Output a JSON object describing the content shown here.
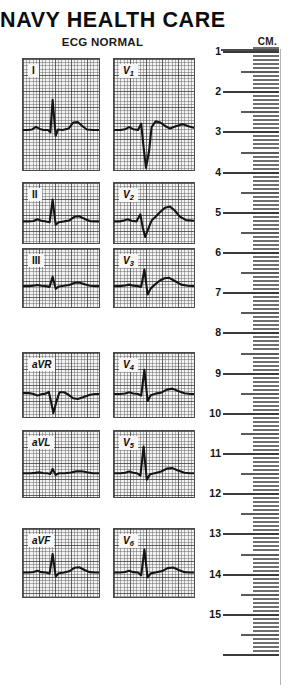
{
  "header": {
    "title": "NAVY HEALTH CARE",
    "subtitle": "ECG NORMAL"
  },
  "ruler": {
    "unit_label": "CM.",
    "labels": [
      "1",
      "2",
      "3",
      "4",
      "5",
      "6",
      "7",
      "8",
      "9",
      "10",
      "11",
      "12",
      "13",
      "14",
      "15"
    ],
    "min_cm": 1,
    "max_cm": 15,
    "tick_color": "#6f6f6f",
    "major_tick_color": "#3a3a3a"
  },
  "colors": {
    "grid_background": "#f3f3f3",
    "grid_line": "#5a5a5a",
    "grid_heavy_line": "#282828",
    "trace": "#151515",
    "text": "#111111"
  },
  "ecg": {
    "columns": 2,
    "rows": 6,
    "leads": [
      {
        "id": "I",
        "label": "I",
        "label_base": "I",
        "label_sub": "",
        "column": 0,
        "row": 0
      },
      {
        "id": "V1",
        "label": "V1",
        "label_base": "V",
        "label_sub": "1",
        "column": 1,
        "row": 0
      },
      {
        "id": "II",
        "label": "II",
        "label_base": "II",
        "label_sub": "",
        "column": 0,
        "row": 1
      },
      {
        "id": "V2",
        "label": "V2",
        "label_base": "V",
        "label_sub": "2",
        "column": 1,
        "row": 1
      },
      {
        "id": "III",
        "label": "III",
        "label_base": "III",
        "label_sub": "",
        "column": 0,
        "row": 2
      },
      {
        "id": "V3",
        "label": "V3",
        "label_base": "V",
        "label_sub": "3",
        "column": 1,
        "row": 2
      },
      {
        "id": "aVR",
        "label": "aVR",
        "label_base": "aVR",
        "label_sub": "",
        "column": 0,
        "row": 3
      },
      {
        "id": "V4",
        "label": "V4",
        "label_base": "V",
        "label_sub": "4",
        "column": 1,
        "row": 3
      },
      {
        "id": "aVL",
        "label": "aVL",
        "label_base": "aVL",
        "label_sub": "",
        "column": 0,
        "row": 4
      },
      {
        "id": "V5",
        "label": "V5",
        "label_base": "V",
        "label_sub": "5",
        "column": 1,
        "row": 4
      },
      {
        "id": "aVF",
        "label": "aVF",
        "label_base": "aVF",
        "label_sub": "",
        "column": 0,
        "row": 5
      },
      {
        "id": "V6",
        "label": "V6",
        "label_base": "V",
        "label_sub": "6",
        "column": 1,
        "row": 5
      }
    ]
  },
  "chart_data": {
    "type": "line",
    "title": "ECG NORMAL",
    "subtitle": "NAVY HEALTH CARE",
    "xlabel": "",
    "ylabel": "",
    "grid": true,
    "legend": "none",
    "series": [
      {
        "name": "I",
        "baseline_y": 0,
        "features": {
          "p_mv": 0.12,
          "q_mv": -0.08,
          "r_mv": 1.05,
          "s_mv": -0.2,
          "t_mv": 0.28
        },
        "points": [
          [
            0,
            0
          ],
          [
            6,
            0
          ],
          [
            12,
            0.02
          ],
          [
            17,
            0.11
          ],
          [
            22,
            0.04
          ],
          [
            27,
            0
          ],
          [
            33,
            0
          ],
          [
            36,
            -0.08
          ],
          [
            39,
            1.05
          ],
          [
            43,
            -0.2
          ],
          [
            46,
            0.02
          ],
          [
            52,
            0
          ],
          [
            60,
            0.05
          ],
          [
            66,
            0.26
          ],
          [
            72,
            0.28
          ],
          [
            78,
            0.14
          ],
          [
            84,
            0.02
          ],
          [
            92,
            0
          ],
          [
            100,
            0
          ]
        ]
      },
      {
        "name": "V1",
        "baseline_y": 0,
        "features": {
          "p_mv": 0.1,
          "q_mv": 0.0,
          "r_mv": 0.22,
          "s_mv": -1.55,
          "t_mv": 0.18
        },
        "points": [
          [
            0,
            0
          ],
          [
            8,
            0
          ],
          [
            14,
            0.03
          ],
          [
            19,
            0.1
          ],
          [
            24,
            0.03
          ],
          [
            30,
            0
          ],
          [
            34,
            0.22
          ],
          [
            37,
            -0.6
          ],
          [
            40,
            -1.55
          ],
          [
            44,
            -0.7
          ],
          [
            47,
            0.1
          ],
          [
            52,
            0.3
          ],
          [
            58,
            0.26
          ],
          [
            64,
            0.14
          ],
          [
            70,
            0.05
          ],
          [
            78,
            0.14
          ],
          [
            86,
            0.2
          ],
          [
            94,
            0.12
          ],
          [
            100,
            0.08
          ]
        ]
      },
      {
        "name": "II",
        "baseline_y": 0,
        "features": {
          "p_mv": 0.14,
          "q_mv": -0.06,
          "r_mv": 1.4,
          "s_mv": -0.22,
          "t_mv": 0.33
        },
        "points": [
          [
            0,
            0
          ],
          [
            8,
            0
          ],
          [
            14,
            0.03
          ],
          [
            19,
            0.14
          ],
          [
            24,
            0.04
          ],
          [
            30,
            0
          ],
          [
            35,
            -0.06
          ],
          [
            39,
            1.4
          ],
          [
            43,
            -0.22
          ],
          [
            47,
            -0.05
          ],
          [
            54,
            0
          ],
          [
            61,
            0.06
          ],
          [
            68,
            0.3
          ],
          [
            74,
            0.33
          ],
          [
            81,
            0.16
          ],
          [
            88,
            0.02
          ],
          [
            95,
            0
          ],
          [
            100,
            0
          ]
        ]
      },
      {
        "name": "V2",
        "baseline_y": 0,
        "features": {
          "p_mv": 0.12,
          "q_mv": 0.0,
          "r_mv": 0.45,
          "s_mv": -1.0,
          "t_mv": 0.95
        },
        "points": [
          [
            0,
            0
          ],
          [
            7,
            0
          ],
          [
            12,
            0.05
          ],
          [
            17,
            0.14
          ],
          [
            22,
            0.04
          ],
          [
            28,
            0
          ],
          [
            33,
            0.45
          ],
          [
            36,
            -0.4
          ],
          [
            39,
            -1.0
          ],
          [
            43,
            -0.45
          ],
          [
            47,
            0.05
          ],
          [
            52,
            0.3
          ],
          [
            58,
            0.62
          ],
          [
            64,
            0.88
          ],
          [
            70,
            0.95
          ],
          [
            76,
            0.7
          ],
          [
            82,
            0.32
          ],
          [
            90,
            0.08
          ],
          [
            100,
            0.04
          ]
        ]
      },
      {
        "name": "III",
        "baseline_y": 0,
        "features": {
          "p_mv": 0.08,
          "q_mv": -0.05,
          "r_mv": 0.62,
          "s_mv": -0.18,
          "t_mv": 0.24
        },
        "points": [
          [
            0,
            0
          ],
          [
            8,
            0
          ],
          [
            14,
            0.03
          ],
          [
            19,
            0.08
          ],
          [
            24,
            0.02
          ],
          [
            30,
            0
          ],
          [
            35,
            -0.05
          ],
          [
            39,
            0.62
          ],
          [
            43,
            -0.18
          ],
          [
            47,
            -0.02
          ],
          [
            54,
            0.02
          ],
          [
            61,
            0.08
          ],
          [
            68,
            0.22
          ],
          [
            74,
            0.24
          ],
          [
            81,
            0.12
          ],
          [
            88,
            0.02
          ],
          [
            95,
            0
          ],
          [
            100,
            0
          ]
        ]
      },
      {
        "name": "V3",
        "baseline_y": 0,
        "features": {
          "p_mv": 0.1,
          "q_mv": -0.05,
          "r_mv": 1.1,
          "s_mv": -0.55,
          "t_mv": 0.55
        },
        "points": [
          [
            0,
            0
          ],
          [
            8,
            0
          ],
          [
            14,
            0.04
          ],
          [
            19,
            0.1
          ],
          [
            24,
            0.03
          ],
          [
            30,
            0
          ],
          [
            34,
            -0.05
          ],
          [
            38,
            1.1
          ],
          [
            42,
            -0.55
          ],
          [
            46,
            -0.15
          ],
          [
            51,
            0.1
          ],
          [
            57,
            0.36
          ],
          [
            63,
            0.52
          ],
          [
            69,
            0.55
          ],
          [
            76,
            0.34
          ],
          [
            84,
            0.1
          ],
          [
            92,
            0.02
          ],
          [
            100,
            0
          ]
        ]
      },
      {
        "name": "aVR",
        "baseline_y": 0,
        "features": {
          "p_mv": -0.1,
          "q_mv": 0.0,
          "r_mv": 0.12,
          "s_mv": -1.15,
          "t_mv": -0.3
        },
        "points": [
          [
            0,
            0.05
          ],
          [
            8,
            0.05
          ],
          [
            14,
            0.0
          ],
          [
            19,
            -0.1
          ],
          [
            24,
            -0.02
          ],
          [
            30,
            0.02
          ],
          [
            34,
            0.12
          ],
          [
            37,
            -0.5
          ],
          [
            40,
            -1.15
          ],
          [
            44,
            -0.45
          ],
          [
            48,
            0.1
          ],
          [
            54,
            0.1
          ],
          [
            60,
            -0.05
          ],
          [
            66,
            -0.26
          ],
          [
            72,
            -0.3
          ],
          [
            79,
            -0.2
          ],
          [
            88,
            -0.05
          ],
          [
            95,
            0
          ],
          [
            100,
            0
          ]
        ]
      },
      {
        "name": "V4",
        "baseline_y": 0,
        "features": {
          "p_mv": 0.1,
          "q_mv": -0.1,
          "r_mv": 1.45,
          "s_mv": -0.42,
          "t_mv": 0.32
        },
        "points": [
          [
            0,
            0
          ],
          [
            8,
            0
          ],
          [
            14,
            0.03
          ],
          [
            19,
            0.1
          ],
          [
            24,
            0.03
          ],
          [
            30,
            0
          ],
          [
            34,
            -0.1
          ],
          [
            38,
            1.45
          ],
          [
            42,
            -0.42
          ],
          [
            46,
            -0.08
          ],
          [
            52,
            0.02
          ],
          [
            59,
            0.08
          ],
          [
            66,
            0.26
          ],
          [
            73,
            0.32
          ],
          [
            80,
            0.18
          ],
          [
            88,
            0.04
          ],
          [
            95,
            0
          ],
          [
            100,
            0
          ]
        ]
      },
      {
        "name": "aVL",
        "baseline_y": 0,
        "features": {
          "p_mv": 0.05,
          "q_mv": -0.04,
          "r_mv": 0.25,
          "s_mv": -0.1,
          "t_mv": 0.12
        },
        "points": [
          [
            0,
            0
          ],
          [
            10,
            0
          ],
          [
            16,
            0.02
          ],
          [
            21,
            0.05
          ],
          [
            26,
            0.01
          ],
          [
            32,
            0
          ],
          [
            36,
            -0.04
          ],
          [
            39,
            0.25
          ],
          [
            43,
            -0.1
          ],
          [
            47,
            0
          ],
          [
            55,
            0
          ],
          [
            63,
            0.04
          ],
          [
            70,
            0.11
          ],
          [
            77,
            0.12
          ],
          [
            84,
            0.06
          ],
          [
            92,
            0
          ],
          [
            100,
            0
          ]
        ]
      },
      {
        "name": "V5",
        "baseline_y": 0,
        "features": {
          "p_mv": 0.1,
          "q_mv": -0.14,
          "r_mv": 1.55,
          "s_mv": -0.38,
          "t_mv": 0.3
        },
        "points": [
          [
            0,
            0
          ],
          [
            8,
            0
          ],
          [
            14,
            0.03
          ],
          [
            19,
            0.1
          ],
          [
            24,
            0.03
          ],
          [
            29,
            0
          ],
          [
            33,
            -0.14
          ],
          [
            37,
            1.55
          ],
          [
            41,
            -0.38
          ],
          [
            45,
            -0.06
          ],
          [
            52,
            0.02
          ],
          [
            59,
            0.1
          ],
          [
            66,
            0.27
          ],
          [
            73,
            0.3
          ],
          [
            80,
            0.16
          ],
          [
            88,
            0.03
          ],
          [
            95,
            0
          ],
          [
            100,
            0
          ]
        ]
      },
      {
        "name": "aVF",
        "baseline_y": 0,
        "features": {
          "p_mv": 0.1,
          "q_mv": -0.06,
          "r_mv": 1.05,
          "s_mv": -0.22,
          "t_mv": 0.3
        },
        "points": [
          [
            0,
            0
          ],
          [
            8,
            0
          ],
          [
            14,
            0.03
          ],
          [
            19,
            0.1
          ],
          [
            24,
            0.02
          ],
          [
            30,
            0
          ],
          [
            35,
            -0.06
          ],
          [
            39,
            1.05
          ],
          [
            43,
            -0.22
          ],
          [
            47,
            -0.04
          ],
          [
            54,
            0
          ],
          [
            61,
            0.07
          ],
          [
            68,
            0.27
          ],
          [
            74,
            0.3
          ],
          [
            81,
            0.14
          ],
          [
            88,
            0.02
          ],
          [
            95,
            0
          ],
          [
            100,
            0
          ]
        ]
      },
      {
        "name": "V6",
        "baseline_y": 0,
        "features": {
          "p_mv": 0.1,
          "q_mv": -0.16,
          "r_mv": 1.3,
          "s_mv": -0.28,
          "t_mv": 0.28
        },
        "points": [
          [
            0,
            0
          ],
          [
            8,
            0
          ],
          [
            14,
            0.03
          ],
          [
            19,
            0.1
          ],
          [
            24,
            0.02
          ],
          [
            30,
            0
          ],
          [
            34,
            -0.16
          ],
          [
            38,
            1.3
          ],
          [
            42,
            -0.28
          ],
          [
            46,
            -0.05
          ],
          [
            53,
            0.01
          ],
          [
            60,
            0.08
          ],
          [
            67,
            0.25
          ],
          [
            74,
            0.28
          ],
          [
            81,
            0.14
          ],
          [
            88,
            0.02
          ],
          [
            95,
            0
          ],
          [
            100,
            0
          ]
        ]
      }
    ]
  }
}
